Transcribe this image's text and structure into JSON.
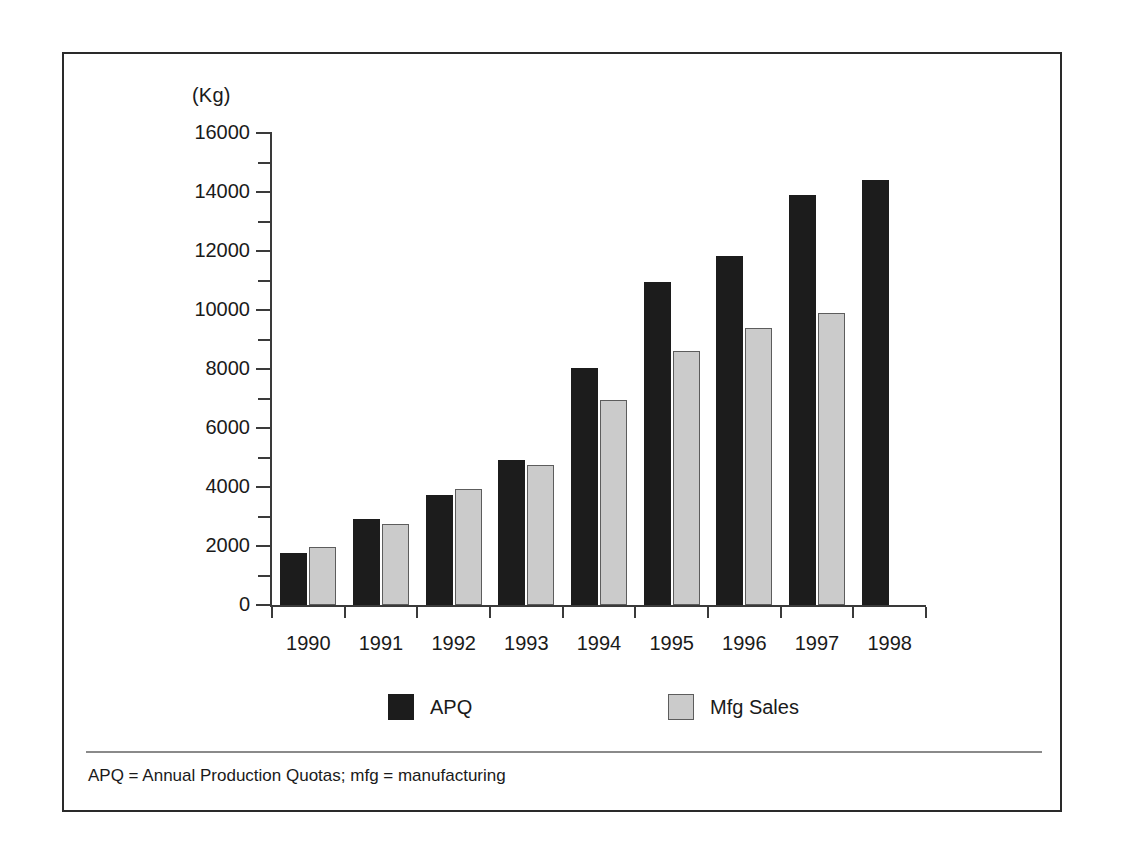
{
  "figure": {
    "y_unit_label": "(Kg)",
    "footnote": "APQ = Annual Production Quotas; mfg = manufacturing"
  },
  "legend": {
    "items": [
      {
        "label": "APQ",
        "color": "#1c1c1c",
        "swatch": "apq"
      },
      {
        "label": "Mfg Sales",
        "color": "#cbcbcb",
        "swatch": "mfg"
      }
    ]
  },
  "axis": {
    "y_major_ticks": [
      "0",
      "2000",
      "4000",
      "6000",
      "8000",
      "10000",
      "12000",
      "14000",
      "16000"
    ],
    "y_minor_step": 1000,
    "y_min": 0,
    "y_max": 16000
  },
  "chart_data": {
    "type": "bar",
    "title": "",
    "subtitle": "",
    "xlabel": "",
    "ylabel": "(Kg)",
    "ylim": [
      0,
      16000
    ],
    "ytick_step": 2000,
    "yminor_step": 1000,
    "grid": false,
    "legend_position": "bottom",
    "categories": [
      "1990",
      "1991",
      "1992",
      "1993",
      "1994",
      "1995",
      "1996",
      "1997",
      "1998"
    ],
    "series": [
      {
        "name": "APQ",
        "color": "#1c1c1c",
        "values": [
          1750,
          2920,
          3740,
          4930,
          8030,
          10950,
          11820,
          13900,
          14400
        ]
      },
      {
        "name": "Mfg Sales",
        "color": "#cbcbcb",
        "values": [
          1950,
          2730,
          3930,
          4730,
          6940,
          8600,
          9400,
          9900,
          null
        ]
      }
    ],
    "annotations": [
      "APQ = Annual Production Quotas; mfg = manufacturing"
    ]
  }
}
